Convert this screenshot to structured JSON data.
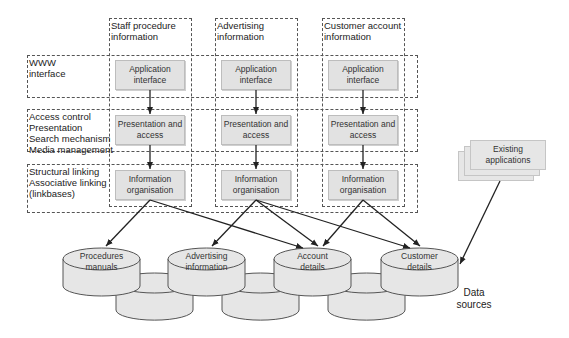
{
  "columns": [
    {
      "title_line1": "Staff procedure",
      "title_line2": "information"
    },
    {
      "title_line1": "Advertising",
      "title_line2": "information"
    },
    {
      "title_line1": "Customer account",
      "title_line2": "information"
    }
  ],
  "rows": [
    {
      "lines": [
        "WWW",
        "interface"
      ],
      "box_line1": "Application",
      "box_line2": "interface"
    },
    {
      "lines": [
        "Access control",
        "Presentation",
        "Search mechanism",
        "Media management"
      ],
      "box_line1": "Presentation and",
      "box_line2": "access"
    },
    {
      "lines": [
        "Structural linking",
        "Associative linking",
        "(linkbases)"
      ],
      "box_line1": "Information",
      "box_line2": "organisation"
    }
  ],
  "existing_apps": {
    "line1": "Existing",
    "line2": "applications"
  },
  "data_stores": [
    {
      "line1": "Procedures",
      "line2": "manuals"
    },
    {
      "line1": "Advertising",
      "line2": "information"
    },
    {
      "line1": "Account",
      "line2": "details"
    },
    {
      "line1": "Customer",
      "line2": "details"
    }
  ],
  "data_sources_label": {
    "line1": "Data",
    "line2": "sources"
  },
  "colors": {
    "box_fill": "#e2e2e2",
    "cylinder_fill": "#e6e6e6",
    "line": "#222222",
    "dash": "#555555"
  }
}
